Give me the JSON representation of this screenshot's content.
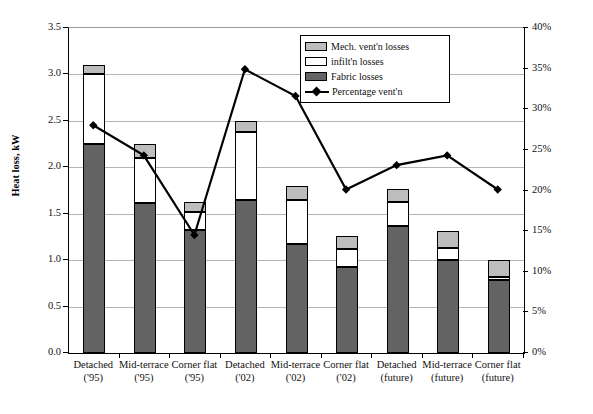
{
  "chart_data": {
    "type": "bar",
    "title": "",
    "xlabel": "",
    "ylabel": "Heat loss, kW",
    "y2label": "Percentage vent'n loss",
    "ylim": [
      0.0,
      3.5
    ],
    "y2lim": [
      0,
      40
    ],
    "ytick_step": 0.5,
    "y2tick_step": 5,
    "grid": true,
    "stacked": true,
    "legend_position": "top-center",
    "categories": [
      {
        "line1": "Detached",
        "line2": "('95)"
      },
      {
        "line1": "Mid-terrace",
        "line2": "('95)"
      },
      {
        "line1": "Corner flat",
        "line2": "('95)"
      },
      {
        "line1": "Detached",
        "line2": "('02)"
      },
      {
        "line1": "Mid-terrace",
        "line2": "('02)"
      },
      {
        "line1": "Corner flat",
        "line2": "('02)"
      },
      {
        "line1": "Detached",
        "line2": "(future)"
      },
      {
        "line1": "Mid-terrace",
        "line2": "(future)"
      },
      {
        "line1": "Corner flat",
        "line2": "(future)"
      }
    ],
    "ytick_labels": [
      "0.0",
      "0.5",
      "1.0",
      "1.5",
      "2.0",
      "2.5",
      "3.0",
      "3.5"
    ],
    "ytick_values": [
      0.0,
      0.5,
      1.0,
      1.5,
      2.0,
      2.5,
      3.0,
      3.5
    ],
    "y2tick_labels": [
      "0%",
      "5%",
      "10%",
      "15%",
      "20%",
      "25%",
      "30%",
      "35%",
      "40%"
    ],
    "y2tick_values": [
      0,
      5,
      10,
      15,
      20,
      25,
      30,
      35,
      40
    ],
    "series": [
      {
        "name": "Fabric losses",
        "axis": "left",
        "color": "#636363",
        "values": [
          2.25,
          1.61,
          1.32,
          1.65,
          1.17,
          0.93,
          1.37,
          1.0,
          0.79
        ]
      },
      {
        "name": "infilt'n losses",
        "axis": "left",
        "color": "#ffffff",
        "values": [
          0.75,
          0.49,
          0.2,
          0.73,
          0.48,
          0.19,
          0.26,
          0.13,
          0.03
        ]
      },
      {
        "name": "Mech. vent'n losses",
        "axis": "left",
        "color": "#bdbdbd",
        "values": [
          0.1,
          0.15,
          0.11,
          0.12,
          0.15,
          0.14,
          0.14,
          0.18,
          0.18
        ]
      },
      {
        "name": "Percentage vent'n",
        "axis": "right",
        "type": "line",
        "color": "#000000",
        "marker": "diamond",
        "values": [
          27.9,
          24.2,
          14.4,
          34.8,
          31.5,
          20.0,
          23.0,
          24.2,
          20.0
        ]
      }
    ],
    "stack_totals": [
      3.1,
      2.25,
      1.63,
      2.5,
      1.8,
      1.26,
      1.77,
      1.31,
      1.0
    ]
  },
  "legend": {
    "items": [
      {
        "label": "Mech. vent'n losses",
        "kind": "swatch",
        "swatch_class": "sw-mech"
      },
      {
        "label": "infilt'n losses",
        "kind": "swatch",
        "swatch_class": "sw-infil"
      },
      {
        "label": "Fabric losses",
        "kind": "swatch",
        "swatch_class": "sw-fabric"
      },
      {
        "label": "Percentage vent'n",
        "kind": "line",
        "swatch_class": "sw-line"
      }
    ]
  }
}
